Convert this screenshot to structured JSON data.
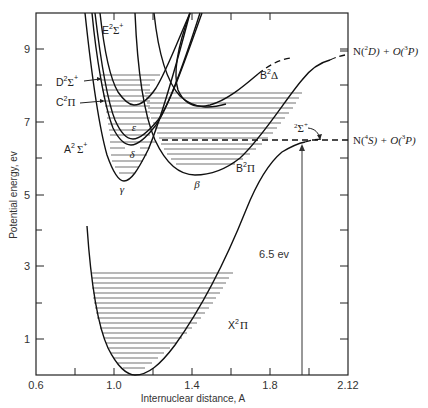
{
  "figure": {
    "type": "potential energy diagram",
    "y_axis": {
      "title": "Potential energy, ev",
      "tick_labels": [
        "9",
        "7",
        "5",
        "3",
        "1"
      ],
      "range": [
        0,
        10
      ]
    },
    "x_axis": {
      "title": "Internuclear distance, A",
      "tick_labels": [
        "0.6",
        "1.0",
        "1.4",
        "1.8",
        "2.12"
      ],
      "range": [
        0.6,
        2.12
      ]
    },
    "states": {
      "E": {
        "base": "E",
        "sup": "2",
        "sym": "Σ",
        "supsign": "+"
      },
      "D": {
        "base": "D",
        "sup": "2",
        "sym": "Σ",
        "supsign": "+"
      },
      "C": {
        "base": "C",
        "sup": "2",
        "sym": "Π"
      },
      "A": {
        "base": "A",
        "sup": "2",
        "sym": "Σ",
        "supsign": "+"
      },
      "B_delta": {
        "base": "B",
        "sup": "2",
        "sym": "Δ"
      },
      "B_pi": {
        "base": "B",
        "sup": "2",
        "sym": "Π"
      },
      "sigma": {
        "sup": "2",
        "sym": "Σ",
        "supsign": "+"
      },
      "X": {
        "base": "X",
        "sup": "2",
        "sym": "Π"
      }
    },
    "band_labels": {
      "gamma": "γ",
      "delta": "δ",
      "epsilon": "ε",
      "beta": "β"
    },
    "asymptotes": {
      "upper": {
        "n": "N(",
        "n_sup": "2",
        "n_term": "D) + O(",
        "o_sup": "3",
        "o_term": "P)"
      },
      "lower": {
        "n": "N(",
        "n_sup": "4",
        "n_term": "S) + O(",
        "o_sup": "3",
        "o_term": "P)"
      }
    },
    "dissociation_annotation": "6.5 ev"
  }
}
